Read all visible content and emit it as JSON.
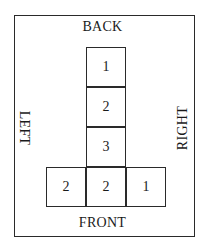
{
  "diagram": {
    "type": "top-view block stacking plan",
    "labels": {
      "back": "BACK",
      "front": "FRONT",
      "left": "LEFT",
      "right": "RIGHT"
    },
    "grid": [
      {
        "row": 0,
        "col": 1,
        "value": "1"
      },
      {
        "row": 1,
        "col": 1,
        "value": "2"
      },
      {
        "row": 2,
        "col": 1,
        "value": "3"
      },
      {
        "row": 3,
        "col": 0,
        "value": "2"
      },
      {
        "row": 3,
        "col": 1,
        "value": "2"
      },
      {
        "row": 3,
        "col": 2,
        "value": "1"
      }
    ],
    "colors": {
      "line": "#2a2a2a",
      "text": "#1a1a1a",
      "background": "#ffffff"
    }
  }
}
